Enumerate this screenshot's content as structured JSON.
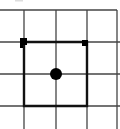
{
  "diagram": {
    "type": "grid-path",
    "grid": {
      "vertical_lines_x": [
        24,
        56,
        87,
        117
      ],
      "horizontal_lines_y": [
        10,
        42,
        74,
        106
      ],
      "line_color": "#333333"
    },
    "path": {
      "points": [
        [
          24,
          42
        ],
        [
          87,
          42
        ],
        [
          87,
          106
        ],
        [
          24,
          106
        ],
        [
          24,
          42
        ]
      ],
      "color": "#111111"
    },
    "markers": [
      {
        "shape": "square",
        "x": 24,
        "y": 42,
        "size": 7
      },
      {
        "shape": "square",
        "x": 85,
        "y": 43,
        "size": 6
      }
    ],
    "dot": {
      "x": 56,
      "y": 74,
      "r": 6,
      "color": "#000000"
    }
  }
}
